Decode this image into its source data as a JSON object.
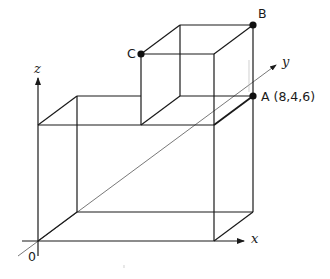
{
  "diagram": {
    "type": "3d-box-composition",
    "axes": {
      "x_label": "x",
      "y_label": "y",
      "z_label": "z",
      "origin_label": "0"
    },
    "points": {
      "A": {
        "label": "A (8,4,6)",
        "name": "A",
        "coords": "(8,4,6)"
      },
      "B": {
        "label": "B",
        "name": "B"
      },
      "C": {
        "label": "C",
        "name": "C"
      }
    },
    "colors": {
      "line": "#1a1a1a",
      "axis_thin": "#555555",
      "point": "#111111"
    }
  }
}
